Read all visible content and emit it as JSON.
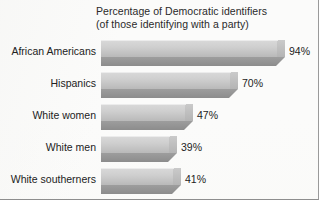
{
  "chart_data": {
    "type": "bar",
    "orientation": "horizontal",
    "title": "Percentage of Democratic identifiers",
    "subtitle": "(of those identifying with a party)",
    "xlabel": "",
    "ylabel": "",
    "xlim": [
      0,
      100
    ],
    "grid": false,
    "legend": null,
    "value_suffix": "%",
    "categories": [
      "African Americans",
      "Hispanics",
      "White women",
      "White men",
      "White southerners"
    ],
    "values": [
      94,
      70,
      47,
      39,
      41
    ],
    "value_labels": [
      "94%",
      "70%",
      "47%",
      "39%",
      "41%"
    ],
    "bars": [
      {
        "category": "African Americans",
        "value": 94,
        "label": "94%"
      },
      {
        "category": "Hispanics",
        "value": 70,
        "label": "70%"
      },
      {
        "category": "White women",
        "value": 47,
        "label": "47%"
      },
      {
        "category": "White men",
        "value": 39,
        "label": "39%"
      },
      {
        "category": "White southerners",
        "value": 41,
        "label": "41%"
      }
    ],
    "style": {
      "bar_face_light": "#d8d8d8",
      "bar_face_dark": "#b9b9b9",
      "bar_shadow": "#949494",
      "background": "#fbfbfa",
      "text": "#232323",
      "border": "#9a9a9a"
    },
    "pixel_scale": {
      "bar_left_px": 101,
      "bar_px_per_unit": 1.96
    }
  }
}
